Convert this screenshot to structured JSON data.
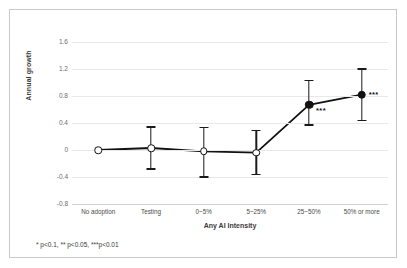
{
  "chart_data": {
    "type": "line",
    "title": "",
    "xlabel": "Any AI Intensity",
    "ylabel": "Annual growth",
    "categories": [
      "No adoption",
      "Testing",
      "0~5%",
      "5~25%",
      "25~50%",
      "50% or more"
    ],
    "values": [
      0.0,
      0.03,
      -0.02,
      -0.04,
      0.67,
      0.82
    ],
    "error_low": [
      0.0,
      -0.27,
      -0.39,
      -0.35,
      0.38,
      0.45
    ],
    "error_high": [
      0.0,
      0.35,
      0.34,
      0.3,
      1.04,
      1.21
    ],
    "marker_style": [
      "open",
      "open",
      "open",
      "open",
      "filled",
      "filled"
    ],
    "significance": [
      "",
      "",
      "",
      "",
      "***",
      "***"
    ],
    "yticks": [
      "1.6",
      "1.2",
      "0.8",
      "0.4",
      "0",
      "-0.4",
      "-0.8"
    ],
    "ytick_values": [
      1.6,
      1.2,
      0.8,
      0.4,
      0,
      -0.4,
      -0.8
    ],
    "ylim": [
      -0.8,
      1.6
    ],
    "grid": true,
    "legend": "none",
    "series_color": "#111111",
    "grid_color": "#e8e8e8"
  },
  "footnote": {
    "text": "* p<0.1, ** p<0.05, ***p<0.01"
  }
}
